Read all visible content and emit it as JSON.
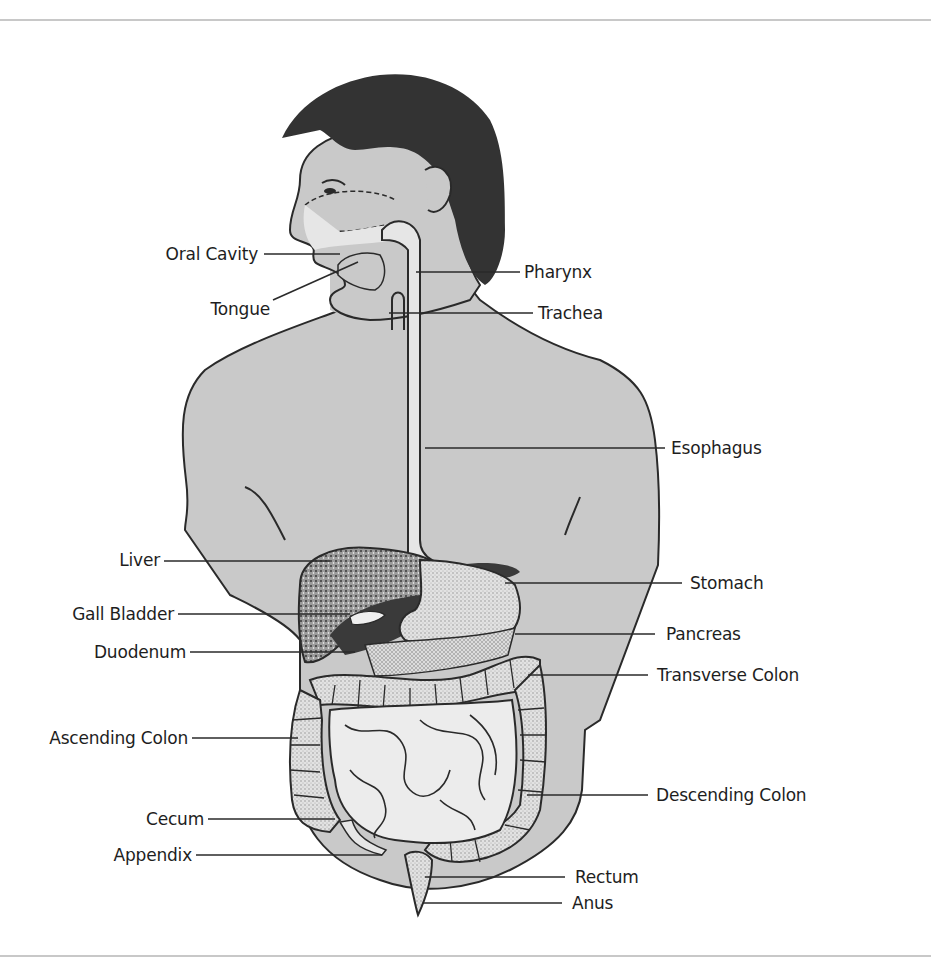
{
  "diagram": {
    "colors": {
      "skin": "#c9c9c9",
      "hair": "#333333",
      "tract": "#e6e6e6",
      "outline": "#2a2a2a",
      "liver": "#8a8a8a",
      "dark_organ": "#3a3a3a",
      "intestine": "#ececec",
      "colon": "#d8d8d8",
      "rule": "#c8c8c8"
    },
    "labels_left": [
      {
        "id": "oral-cavity",
        "text": "Oral Cavity"
      },
      {
        "id": "tongue",
        "text": "Tongue"
      },
      {
        "id": "liver",
        "text": "Liver"
      },
      {
        "id": "gall-bladder",
        "text": "Gall Bladder"
      },
      {
        "id": "duodenum",
        "text": "Duodenum"
      },
      {
        "id": "ascending-colon",
        "text": "Ascending Colon"
      },
      {
        "id": "cecum",
        "text": "Cecum"
      },
      {
        "id": "appendix",
        "text": "Appendix"
      }
    ],
    "labels_right": [
      {
        "id": "pharynx",
        "text": "Pharynx"
      },
      {
        "id": "trachea",
        "text": "Trachea"
      },
      {
        "id": "esophagus",
        "text": "Esophagus"
      },
      {
        "id": "stomach",
        "text": "Stomach"
      },
      {
        "id": "pancreas",
        "text": "Pancreas"
      },
      {
        "id": "transverse-colon",
        "text": "Transverse Colon"
      },
      {
        "id": "descending-colon",
        "text": "Descending Colon"
      },
      {
        "id": "rectum",
        "text": "Rectum"
      },
      {
        "id": "anus",
        "text": "Anus"
      }
    ]
  }
}
